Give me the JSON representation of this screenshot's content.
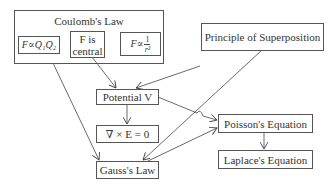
{
  "diagram": {
    "nodes": {
      "coulomb": {
        "label": "Coulomb's Law"
      },
      "f_q1q2": {
        "label": "F∝Q₁Q₂"
      },
      "f_central_1": {
        "label": "F is"
      },
      "f_central_2": {
        "label": "central"
      },
      "f_inv_r2": {
        "prefix": "F∝",
        "num": "1",
        "den": "r²"
      },
      "superposition": {
        "label": "Principle of Superposition"
      },
      "potential": {
        "label": "Potential V"
      },
      "curl": {
        "label": "∇ × E = 0"
      },
      "gauss": {
        "label": "Gauss's Law"
      },
      "poisson": {
        "label": "Poisson's Equation"
      },
      "laplace": {
        "label": "Laplace's Equation"
      }
    },
    "edges": [
      {
        "from": "coulomb",
        "to": "gauss"
      },
      {
        "from": "f_central",
        "to": "potential"
      },
      {
        "from": "superposition",
        "to": "potential"
      },
      {
        "from": "superposition",
        "to": "gauss"
      },
      {
        "from": "potential",
        "to": "curl"
      },
      {
        "from": "potential",
        "to": "poisson"
      },
      {
        "from": "gauss",
        "to": "poisson"
      },
      {
        "from": "poisson",
        "to": "laplace"
      }
    ]
  }
}
